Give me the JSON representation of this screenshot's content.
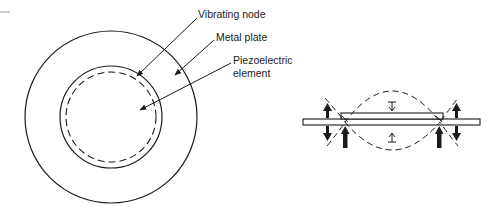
{
  "diagram": {
    "type": "piezoelectric buzzer construction",
    "top_view": {
      "labels": [
        {
          "id": "vibrating-node",
          "text": "Vibrating node"
        },
        {
          "id": "metal-plate",
          "text": "Metal plate"
        },
        {
          "id": "piezo-line1",
          "text": "Piezoelectric"
        },
        {
          "id": "piezo-line2",
          "text": "element"
        }
      ]
    },
    "side_view": {
      "description": "Cross-section showing plate flexing with supports at vibrating nodes"
    },
    "colors": {
      "ink": "#1a1a1a",
      "background": "#ffffff",
      "faint_mark": "#9a9a9a"
    }
  }
}
